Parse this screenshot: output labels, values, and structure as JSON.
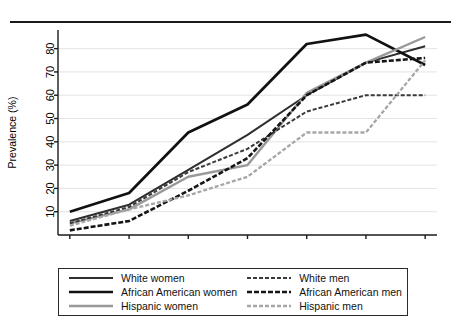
{
  "chart_data": {
    "type": "line",
    "title": "",
    "xlabel": "Age group",
    "ylabel": "Prevalence (%)",
    "x": [
      20,
      30,
      40,
      50,
      60,
      70,
      80
    ],
    "xlim": [
      18,
      82
    ],
    "ylim": [
      0,
      88
    ],
    "xticks": [
      "20",
      "30",
      "40",
      "50",
      "60",
      "70",
      "80"
    ],
    "yticks": [
      "10",
      "20",
      "30",
      "40",
      "50",
      "60",
      "70",
      "80"
    ],
    "grid": "horizontal",
    "legend_position": "below-plot",
    "series": [
      {
        "name": "White women",
        "values": [
          6,
          13,
          28,
          43,
          60,
          74,
          81
        ],
        "color": "#2e2e2e",
        "width": 2.0,
        "dash": "none"
      },
      {
        "name": "African American women",
        "values": [
          10,
          18,
          44,
          56,
          82,
          86,
          73
        ],
        "color": "#111111",
        "width": 2.7,
        "dash": "none"
      },
      {
        "name": "Hispanic women",
        "values": [
          5,
          11,
          25,
          30,
          61,
          74,
          85
        ],
        "color": "#999999",
        "width": 2.4,
        "dash": "none"
      },
      {
        "name": "White men",
        "values": [
          5,
          12,
          27,
          37,
          53,
          60,
          60
        ],
        "color": "#3a3a3a",
        "width": 2.0,
        "dash": "4,2"
      },
      {
        "name": "African American men",
        "values": [
          2,
          6,
          19,
          33,
          60,
          74,
          76
        ],
        "color": "#151515",
        "width": 2.6,
        "dash": "5,2"
      },
      {
        "name": "Hispanic men",
        "values": [
          4,
          11,
          17,
          25,
          44,
          44,
          75
        ],
        "color": "#a6a6a6",
        "width": 2.3,
        "dash": "4,2"
      }
    ]
  },
  "legend": {
    "entries": [
      {
        "label": "White women"
      },
      {
        "label": "White men"
      },
      {
        "label": "African American women"
      },
      {
        "label": "African American men"
      },
      {
        "label": "Hispanic women"
      },
      {
        "label": "Hispanic men"
      }
    ]
  },
  "axes": {
    "y_label": "Prevalence (%)",
    "x_label": "Age group"
  }
}
